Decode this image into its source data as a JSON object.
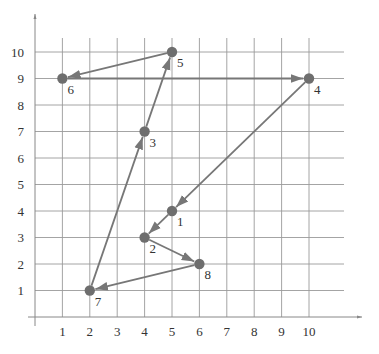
{
  "chart_data": {
    "type": "scatter",
    "title": "",
    "xlabel": "",
    "ylabel": "",
    "xlim": [
      0,
      11
    ],
    "ylim": [
      0,
      11
    ],
    "grid": true,
    "x_ticks": [
      1,
      2,
      3,
      4,
      5,
      6,
      7,
      8,
      9,
      10
    ],
    "y_ticks": [
      1,
      2,
      3,
      4,
      5,
      6,
      7,
      8,
      9,
      10
    ],
    "points": [
      {
        "label": "1",
        "x": 5,
        "y": 4
      },
      {
        "label": "2",
        "x": 4,
        "y": 3
      },
      {
        "label": "3",
        "x": 4,
        "y": 7
      },
      {
        "label": "4",
        "x": 10,
        "y": 9
      },
      {
        "label": "5",
        "x": 5,
        "y": 10
      },
      {
        "label": "6",
        "x": 1,
        "y": 9
      },
      {
        "label": "7",
        "x": 2,
        "y": 1
      },
      {
        "label": "8",
        "x": 6,
        "y": 2
      }
    ],
    "path_order": [
      "1",
      "2",
      "8",
      "7",
      "3",
      "5",
      "6",
      "4",
      "1"
    ],
    "arrows": true,
    "colors": {
      "line": "#777777",
      "point": "#6e6e6e",
      "grid": "#9a9a9a"
    }
  }
}
